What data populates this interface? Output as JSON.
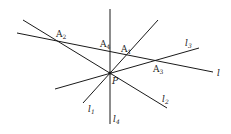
{
  "diagram": {
    "point_P": {
      "label": "P",
      "x": 110,
      "y": 73
    },
    "lines": [
      {
        "id": "l",
        "label": "l",
        "x1": 17,
        "y1": 33,
        "x2": 213,
        "y2": 72,
        "label_x": 217,
        "label_y": 76
      },
      {
        "id": "l1",
        "label": "l",
        "sub": "1",
        "x1": 83,
        "y1": 103,
        "x2": 158,
        "y2": 20,
        "label_x": 88,
        "label_y": 112
      },
      {
        "id": "l2",
        "label": "l",
        "sub": "2",
        "x1": 23,
        "y1": 20,
        "x2": 167,
        "y2": 108,
        "label_x": 162,
        "label_y": 102
      },
      {
        "id": "l3",
        "label": "l",
        "sub": "3",
        "x1": 55,
        "y1": 89,
        "x2": 199,
        "y2": 48,
        "label_x": 185,
        "label_y": 46
      },
      {
        "id": "l4",
        "label": "l",
        "sub": "4",
        "x1": 110,
        "y1": 9,
        "x2": 110,
        "y2": 124,
        "label_x": 113,
        "label_y": 122
      }
    ],
    "points": [
      {
        "id": "A1",
        "label": "A",
        "sub": "1",
        "x": 121,
        "y": 52
      },
      {
        "id": "A2",
        "label": "A",
        "sub": "2",
        "x": 56,
        "y": 37
      },
      {
        "id": "A3",
        "label": "A",
        "sub": "3",
        "x": 153,
        "y": 72
      },
      {
        "id": "A4",
        "label": "A",
        "sub": "4",
        "x": 100,
        "y": 47
      }
    ]
  }
}
